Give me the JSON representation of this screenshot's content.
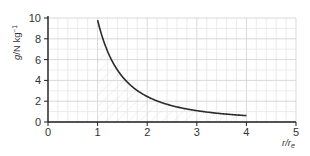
{
  "chart_data": {
    "type": "line",
    "title": "",
    "xlabel": "r/r_e",
    "ylabel": "g/N kg^-1",
    "xlim": [
      0,
      5
    ],
    "ylim": [
      0,
      10
    ],
    "xticks": [
      0,
      1,
      2,
      3,
      4,
      5
    ],
    "yticks": [
      0,
      2,
      4,
      6,
      8,
      10
    ],
    "grid": true,
    "legend": null,
    "series": [
      {
        "name": "g vs r/r_e",
        "x": [
          1.0,
          1.25,
          1.5,
          1.75,
          2.0,
          2.5,
          3.0,
          3.5,
          4.0
        ],
        "values": [
          9.8,
          6.27,
          4.36,
          3.2,
          2.45,
          1.57,
          1.09,
          0.8,
          0.61
        ]
      }
    ],
    "annotations": [
      "faint hatched shading under curve between r/r_e = 1 and 4"
    ]
  },
  "labels": {
    "ylabel_main": "g",
    "ylabel_unit": "/N kg",
    "ylabel_sup": "−1",
    "xlabel_main": "r/r",
    "xlabel_sub": "e"
  },
  "colors": {
    "curve": "#2b2b2b",
    "axis": "#222222",
    "grid_minor": "#e6e6e6",
    "grid_major": "#cfcfcf",
    "hatch": "#d8d8d8"
  }
}
